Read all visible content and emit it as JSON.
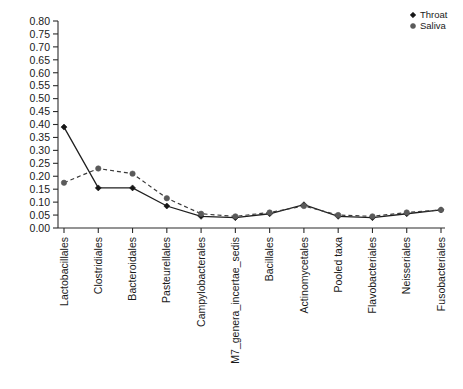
{
  "chart_data": {
    "type": "line",
    "title": "",
    "xlabel": "",
    "ylabel": "",
    "ylim": [
      0.0,
      0.8
    ],
    "ytick_step": 0.05,
    "grid": false,
    "legend_position": "top-right",
    "categories": [
      "Lactobacillales",
      "Clostridiales",
      "Bacteroidales",
      "Pasteurellales",
      "Campylobacterales",
      "M7_genera_incertae_sedis",
      "Bacillales",
      "Actinomycetales",
      "Pooled taxa",
      "Flavobacteriales",
      "Neisseriales",
      "Fusobacteriales"
    ],
    "ytick_labels": [
      "0.00",
      "0.05",
      "0.10",
      "0.15",
      "0.20",
      "0.25",
      "0.30",
      "0.35",
      "0.40",
      "0.45",
      "0.50",
      "0.55",
      "0.60",
      "0.65",
      "0.70",
      "0.75",
      "0.80"
    ],
    "series": [
      {
        "name": "Throat",
        "style": "solid",
        "marker": "filled-diamond",
        "color": "#161616",
        "values": [
          0.39,
          0.155,
          0.155,
          0.085,
          0.045,
          0.04,
          0.055,
          0.09,
          0.045,
          0.04,
          0.055,
          0.07
        ]
      },
      {
        "name": "Saliva",
        "style": "dashed",
        "marker": "filled-circle",
        "color": "#5a5a5a",
        "values": [
          0.175,
          0.23,
          0.21,
          0.115,
          0.055,
          0.045,
          0.06,
          0.085,
          0.05,
          0.045,
          0.06,
          0.07
        ]
      }
    ]
  },
  "legend": {
    "entries": [
      {
        "label": "Throat",
        "marker": "filled-diamond",
        "color": "#161616"
      },
      {
        "label": "Saliva",
        "marker": "filled-circle",
        "color": "#5a5a5a"
      }
    ]
  },
  "colors": {
    "background": "#ffffff",
    "axis": "#2b2b2b",
    "throat": "#161616",
    "saliva": "#5a5a5a"
  }
}
